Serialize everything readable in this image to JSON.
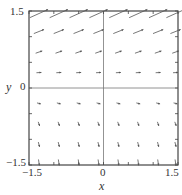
{
  "chart_data": {
    "type": "vector_field",
    "title": "",
    "xlabel": "x",
    "ylabel": "y",
    "xlim": [
      -1.5,
      1.5
    ],
    "ylim": [
      -1.5,
      1.5
    ],
    "x_ticks": [
      "-1.5",
      "0",
      "1.5"
    ],
    "y_ticks": [
      "1.5",
      "0",
      "-1.5"
    ],
    "grid": false,
    "axes_lines_at_zero": true,
    "grid_points_x": [
      -1.3,
      -0.9,
      -0.5,
      -0.1,
      0.3,
      0.7,
      1.1,
      1.45
    ],
    "grid_points_y": [
      1.45,
      1.1,
      0.7,
      0.3,
      -0.3,
      -0.7,
      -1.1,
      -1.45
    ],
    "arrow_rows": [
      {
        "y": 1.45,
        "dx": 1.0,
        "dy": 0.45,
        "scale": 1.0
      },
      {
        "y": 1.1,
        "dx": 1.0,
        "dy": 0.4,
        "scale": 0.55
      },
      {
        "y": 0.7,
        "dx": 1.0,
        "dy": 0.35,
        "scale": 0.35
      },
      {
        "y": 0.3,
        "dx": 1.0,
        "dy": 0.05,
        "scale": 0.25
      },
      {
        "y": -0.3,
        "dx": 1.0,
        "dy": -0.25,
        "scale": 0.2
      },
      {
        "y": -0.7,
        "dx": 0.35,
        "dy": -1.0,
        "scale": 0.22
      },
      {
        "y": -1.1,
        "dx": 0.25,
        "dy": -1.0,
        "scale": 0.25
      },
      {
        "y": -1.45,
        "dx": 0.15,
        "dy": -1.0,
        "scale": 0.3
      }
    ],
    "colors": {
      "arrows": "#555555",
      "frame": "#444444",
      "zero_lines": "#777777"
    }
  },
  "labels": {
    "x_axis": "x",
    "y_axis": "y",
    "x_tick_min": "−1.5",
    "x_tick_zero": "0",
    "x_tick_max": "1.5",
    "y_tick_max": "1.5",
    "y_tick_zero": "0",
    "y_tick_min": "−1.5"
  }
}
